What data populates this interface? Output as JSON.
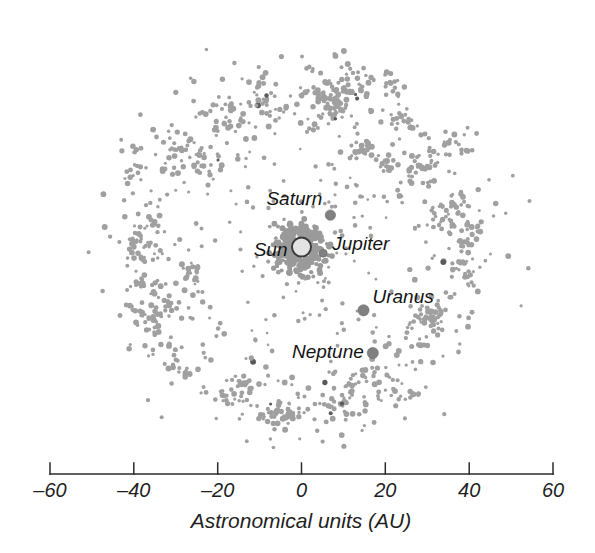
{
  "figure": {
    "name": "kuiper-belt-scatter",
    "background_color": "#ffffff",
    "dot_color": "#a0a0a0",
    "dark_dot_color": "#5a5a5a",
    "planet_color": "#808080",
    "sun_fill": "#e3e3e3",
    "sun_stroke": "#3a3a3a",
    "axis_color": "#2b2b2b"
  },
  "chart_data": {
    "type": "scatter",
    "title": "",
    "subtitle": "",
    "xlabel": "Astronomical units  (AU)",
    "ylabel": "",
    "xlim": [
      -60,
      60
    ],
    "ylim": [
      -60,
      60
    ],
    "xticks": [
      -60,
      -40,
      -20,
      0,
      20,
      40,
      60
    ],
    "xticklabels": [
      "–60",
      "–40",
      "–20",
      "0",
      "20",
      "40",
      "60"
    ],
    "grid": false,
    "legend": "none",
    "series": [
      {
        "name": "Kuiper Belt objects",
        "marker": "filled-circle",
        "color": "#a0a0a0",
        "point_count": 1100,
        "distribution": "annulus",
        "inner_radius_au": 28,
        "outer_radius_au": 50,
        "radial_peak_au": 39,
        "center": [
          0,
          0
        ]
      },
      {
        "name": "Inner asteroid belt / Centaurs",
        "marker": "filled-circle",
        "color": "#9a9a9a",
        "point_count": 260,
        "distribution": "annulus",
        "inner_radius_au": 2,
        "outer_radius_au": 7,
        "radial_peak_au": 4.5,
        "center": [
          0,
          0
        ]
      }
    ],
    "annotations": [
      {
        "label": "Sun",
        "x": 0,
        "y": 0,
        "marker": "open-circle",
        "marker_radius_px": 9.5,
        "label_dx_px": -14,
        "label_dy_px": 9,
        "label_anchor": "end"
      },
      {
        "label": "Jupiter",
        "x": 5.2,
        "y": -1.5,
        "marker": "filled-circle",
        "marker_radius_px": 4.0,
        "label_dx_px": 9,
        "label_dy_px": -3,
        "label_anchor": "start"
      },
      {
        "label": "Saturn",
        "x": 6.9,
        "y": 7.6,
        "marker": "filled-circle",
        "marker_radius_px": 5.2,
        "label_dx_px": -8,
        "label_dy_px": -10,
        "label_anchor": "end"
      },
      {
        "label": "Uranus",
        "x": 14.8,
        "y": -15.1,
        "marker": "filled-circle",
        "marker_radius_px": 5.6,
        "label_dx_px": 9,
        "label_dy_px": -7,
        "label_anchor": "start"
      },
      {
        "label": "Neptune",
        "x": 17.0,
        "y": -25.3,
        "marker": "filled-circle",
        "marker_radius_px": 5.6,
        "label_dx_px": -9,
        "label_dy_px": 5,
        "label_anchor": "end"
      }
    ]
  },
  "axis": {
    "title": "Astronomical units  (AU)",
    "tick_labels": [
      "–60",
      "–40",
      "–20",
      "0",
      "20",
      "40",
      "60"
    ]
  }
}
